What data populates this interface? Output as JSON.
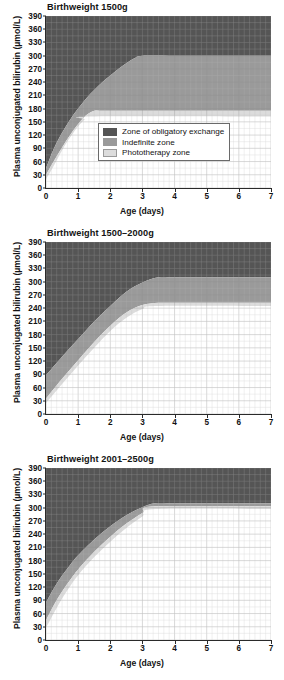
{
  "axes": {
    "ylabel": "Plasma unconjugated bilirubin (µmol/L)",
    "xlabel": "Age (days)",
    "yticks": [
      "0",
      "30",
      "60",
      "90",
      "120",
      "150",
      "180",
      "210",
      "240",
      "270",
      "300",
      "330",
      "360",
      "390"
    ],
    "xticks": [
      "0",
      "1",
      "2",
      "3",
      "4",
      "5",
      "6",
      "7"
    ]
  },
  "legend": {
    "items": [
      {
        "label": "Zone of obligatory exchange",
        "color": "#555555"
      },
      {
        "label": "Indefinite zone",
        "color": "#9a9a9a"
      },
      {
        "label": "Phototherapy zone",
        "color": "#dcdcdc"
      }
    ]
  },
  "colors": {
    "exchange": "#555555",
    "indefinite": "#9a9a9a",
    "phototherapy": "#dcdcdc",
    "safe": "#ffffff",
    "grid_minor": "#b9b9b9",
    "grid_major": "#8f8f8f",
    "axis": "#2a2a2a"
  },
  "chart_data": [
    {
      "type": "area",
      "title": "Birthweight 1500g",
      "xlabel": "Age (days)",
      "ylabel": "Plasma unconjugated bilirubin (µmol/L)",
      "xlim": [
        0,
        7
      ],
      "ylim": [
        0,
        390
      ],
      "grid": true,
      "legend_position": "inside-bottom-center",
      "series": [
        {
          "name": "Zone of obligatory exchange",
          "note": "lower boundary of exchange zone",
          "x": [
            0,
            0.25,
            0.5,
            0.75,
            1.0,
            1.25,
            1.5,
            1.75,
            2.0,
            2.25,
            2.5,
            2.75,
            3.0,
            4.0,
            5.0,
            6.0,
            7.0
          ],
          "y": [
            45,
            90,
            125,
            155,
            180,
            203,
            222,
            240,
            255,
            270,
            283,
            294,
            300,
            300,
            300,
            300,
            300
          ]
        },
        {
          "name": "Indefinite zone",
          "note": "lower boundary of indefinite zone / top of phototherapy zone",
          "x": [
            0,
            0.25,
            0.5,
            0.75,
            1.0,
            1.25,
            1.5,
            1.75,
            2.0,
            3.0,
            4.0,
            5.0,
            6.0,
            7.0
          ],
          "y": [
            30,
            62,
            92,
            120,
            145,
            165,
            175,
            175,
            175,
            175,
            175,
            175,
            175,
            175
          ]
        },
        {
          "name": "Phototherapy zone",
          "note": "lower boundary of phototherapy zone",
          "x": [
            0,
            0.2,
            0.4,
            0.6,
            0.8,
            1.0,
            1.2,
            1.4,
            7.0
          ],
          "y": [
            20,
            45,
            72,
            98,
            120,
            140,
            155,
            162,
            162
          ]
        }
      ]
    },
    {
      "type": "area",
      "title": "Birthweight 1500–2000g",
      "xlabel": "Age (days)",
      "ylabel": "Plasma unconjugated bilirubin (µmol/L)",
      "xlim": [
        0,
        7
      ],
      "ylim": [
        0,
        390
      ],
      "grid": true,
      "legend_position": "none",
      "series": [
        {
          "name": "Zone of obligatory exchange",
          "note": "lower boundary of exchange zone",
          "x": [
            0,
            0.5,
            1.0,
            1.5,
            2.0,
            2.5,
            3.0,
            3.5,
            4.0,
            5.0,
            6.0,
            7.0
          ],
          "y": [
            88,
            130,
            170,
            210,
            245,
            277,
            298,
            310,
            310,
            310,
            310,
            310
          ]
        },
        {
          "name": "Indefinite zone",
          "note": "lower boundary of indefinite zone",
          "x": [
            0,
            0.5,
            1.0,
            1.5,
            2.0,
            2.5,
            3.0,
            3.5,
            4.0,
            5.0,
            6.0,
            7.0
          ],
          "y": [
            35,
            80,
            122,
            163,
            200,
            230,
            247,
            252,
            252,
            252,
            252,
            252
          ]
        },
        {
          "name": "Phototherapy zone",
          "note": "lower boundary of phototherapy zone",
          "x": [
            0,
            0.5,
            1.0,
            1.5,
            2.0,
            2.5,
            3.0,
            3.5,
            7.0
          ],
          "y": [
            25,
            68,
            110,
            150,
            188,
            218,
            238,
            245,
            245
          ]
        }
      ]
    },
    {
      "type": "area",
      "title": "Birthweight 2001–2500g",
      "xlabel": "Age (days)",
      "ylabel": "Plasma unconjugated bilirubin (µmol/L)",
      "xlim": [
        0,
        7
      ],
      "ylim": [
        0,
        390
      ],
      "grid": true,
      "legend_position": "none",
      "series": [
        {
          "name": "Zone of obligatory exchange",
          "note": "lower boundary of exchange zone",
          "x": [
            0,
            0.25,
            0.5,
            0.75,
            1.0,
            1.5,
            2.0,
            2.5,
            3.0,
            3.4,
            4.0,
            5.0,
            6.0,
            7.0
          ],
          "y": [
            85,
            118,
            146,
            170,
            192,
            228,
            258,
            283,
            301,
            310,
            310,
            310,
            310,
            310
          ]
        },
        {
          "name": "Indefinite zone",
          "note": "lower boundary of indefinite zone",
          "x": [
            0,
            0.25,
            0.5,
            0.75,
            1.0,
            1.5,
            2.0,
            2.5,
            3.0,
            3.4,
            7.0
          ],
          "y": [
            45,
            80,
            110,
            136,
            160,
            200,
            234,
            264,
            288,
            303,
            303
          ]
        },
        {
          "name": "Phototherapy zone",
          "note": "lower boundary of phototherapy zone",
          "x": [
            0,
            0.25,
            0.5,
            0.75,
            1.0,
            1.5,
            2.0,
            2.5,
            3.0,
            3.4,
            7.0
          ],
          "y": [
            28,
            62,
            94,
            122,
            147,
            188,
            223,
            254,
            280,
            297,
            297
          ]
        }
      ]
    }
  ]
}
